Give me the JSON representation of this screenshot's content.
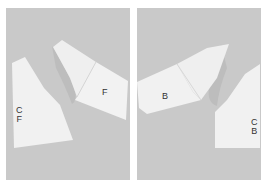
{
  "panels": [
    {
      "id": "front",
      "background": "#c9c9c9",
      "pieces": [
        {
          "name": "center-front-bodice",
          "label_lines": [
            "C",
            "F"
          ]
        },
        {
          "name": "front-sleeve",
          "label_lines": [
            "F"
          ]
        }
      ]
    },
    {
      "id": "back",
      "background": "#c9c9c9",
      "pieces": [
        {
          "name": "back-sleeve",
          "label_lines": [
            "B"
          ]
        },
        {
          "name": "center-back-bodice",
          "label_lines": [
            "C",
            "B"
          ]
        }
      ]
    }
  ],
  "colors": {
    "paper": "#f1f1f1",
    "shadow": "#bdbdbd",
    "text": "#333333"
  }
}
